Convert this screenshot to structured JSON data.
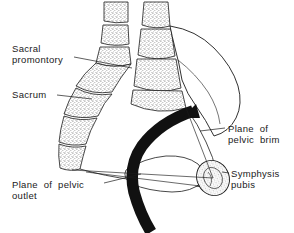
{
  "figure": {
    "background_color": "#ffffff",
    "ink_color": "#1a1a1a",
    "stipple_color": "#3a3a3a",
    "canal_color": "#111111",
    "width": 294,
    "height": 233
  },
  "labels": {
    "sacral_promontory": "Sacral\npromontory",
    "sacrum": "Sacrum",
    "plane_of_pelvic_brim": "Plane  of\npelvic  brim",
    "symphysis_pubis": "Symphysis\npubis",
    "plane_of_pelvic_outlet": "Plane  of  pelvic\noutlet"
  },
  "structures": [
    {
      "name": "lumbar-vertebrae",
      "description": "stippled vertebral bodies, upper left column"
    },
    {
      "name": "sacrum",
      "description": "curved segmented stippled bone"
    },
    {
      "name": "sacral-promontory",
      "description": "anterior projecting edge of first sacral vertebra"
    },
    {
      "name": "ilium",
      "description": "large white iliac blade outline, upper right"
    },
    {
      "name": "symphysis-pubis",
      "description": "small stippled oval, lower right"
    },
    {
      "name": "coccyx-ischium",
      "description": "inner bone outline near pelvic floor"
    },
    {
      "name": "birth-canal-axis",
      "description": "thick black curved band through pelvis"
    }
  ],
  "planes": [
    {
      "name": "pelvic-brim-line",
      "description": "thin line from sacral promontory to symphysis pubis"
    },
    {
      "name": "pelvic-outlet-line",
      "description": "thin line from lower sacrum to symphysis pubis"
    }
  ]
}
